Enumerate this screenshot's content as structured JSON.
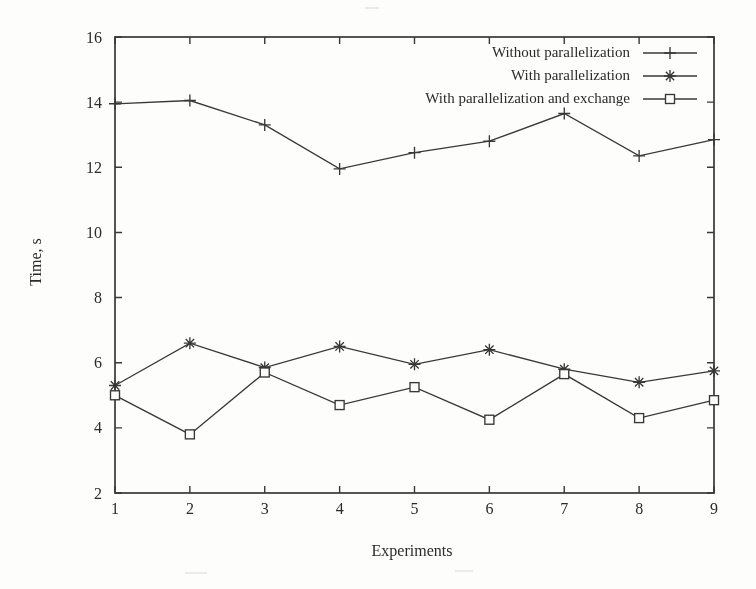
{
  "chart_data": {
    "type": "line",
    "title": "",
    "xlabel": "Experiments",
    "ylabel": "Time, s",
    "xlim": [
      1,
      9
    ],
    "ylim": [
      2,
      16
    ],
    "xticks": [
      "1",
      "2",
      "3",
      "4",
      "5",
      "6",
      "7",
      "8",
      "9"
    ],
    "ytick_values": [
      2,
      4,
      6,
      8,
      10,
      12,
      14,
      16
    ],
    "yticks": [
      "2",
      "4",
      "6",
      "8",
      "10",
      "12",
      "14",
      "16"
    ],
    "grid": false,
    "legend_position": "top-right-inside",
    "ink_color": "#383838",
    "paper_color": "#fdfdfb",
    "x": [
      1,
      2,
      3,
      4,
      5,
      6,
      7,
      8,
      9
    ],
    "series": [
      {
        "name": "Without parallelization",
        "marker": "plus",
        "values": [
          13.95,
          14.05,
          13.3,
          11.95,
          12.45,
          12.8,
          13.65,
          12.35,
          12.85
        ]
      },
      {
        "name": "With parallelization",
        "marker": "asterisk",
        "values": [
          5.3,
          6.6,
          5.85,
          6.5,
          5.95,
          6.4,
          5.8,
          5.4,
          5.75
        ]
      },
      {
        "name": "With parallelization and exchange",
        "marker": "square",
        "values": [
          5.0,
          3.8,
          5.7,
          4.7,
          5.25,
          4.25,
          5.65,
          4.3,
          4.85
        ]
      }
    ]
  }
}
